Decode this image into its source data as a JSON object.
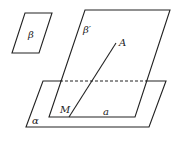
{
  "diagram": {
    "title": "",
    "labels": {
      "beta": "β",
      "beta_prime": "β′",
      "point_a": "A",
      "point_m": "M",
      "line_a": "a",
      "alpha": "α"
    },
    "colors": {
      "stroke": "#222222",
      "background": "#ffffff"
    },
    "shapes": {
      "plane_beta": "12,53 25,13 52,13 39,53",
      "plane_beta_prime": "49,117 85,10 170,10 135,117",
      "plane_alpha": "26,127 43,81 166,81 149,127",
      "segment_ma": {
        "x1": 69,
        "y1": 117,
        "x2": 116,
        "y2": 43
      },
      "line_a": {
        "x1": 49,
        "y1": 117,
        "x2": 135,
        "y2": 117
      },
      "hidden_edge": {
        "x1": 60,
        "y1": 81,
        "x2": 147,
        "y2": 81
      }
    }
  }
}
